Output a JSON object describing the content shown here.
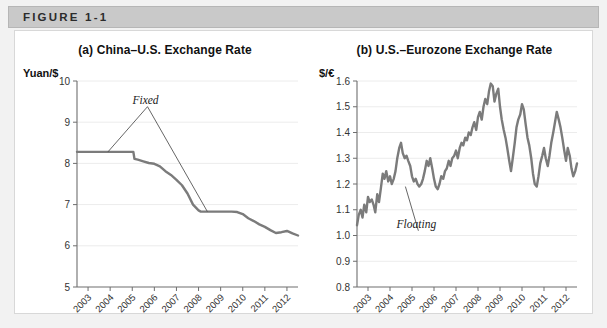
{
  "figure": {
    "header_label": "FIGURE 1-1"
  },
  "panels": [
    {
      "title": "(a) China–U.S. Exchange Rate",
      "unit_label": "Yuan/$",
      "annotation": "Fixed"
    },
    {
      "title": "(b) U.S.–Eurozone Exchange Rate",
      "unit_label": "$/€",
      "annotation": "Floating"
    }
  ],
  "colors": {
    "data_line": "#7b7b7b",
    "axis": "#6e6e6e",
    "grid": "#ececec",
    "header_band": "#c9c9c9",
    "panel_background": "#ffffff",
    "frame_background": "#f2f2f2"
  },
  "chart_data": [
    {
      "type": "line",
      "title": "(a) China–U.S. Exchange Rate",
      "xlabel": "",
      "ylabel": "Yuan/$",
      "ylim": [
        5,
        10
      ],
      "xlim": [
        2003,
        2013
      ],
      "yticks": [
        5,
        6,
        7,
        8,
        9,
        10
      ],
      "xticks": [
        2003,
        2004,
        2005,
        2006,
        2007,
        2008,
        2009,
        2010,
        2011,
        2012
      ],
      "grid": true,
      "legend": "none",
      "annotations": [
        {
          "text": "Fixed",
          "x": 2006.1,
          "y": 9.45,
          "leaders": [
            {
              "x": 2004.4,
              "y": 8.28
            },
            {
              "x": 2008.9,
              "y": 6.83
            }
          ]
        }
      ],
      "series": [
        {
          "name": "Yuan per US dollar",
          "x": [
            2003.0,
            2003.5,
            2004.0,
            2004.5,
            2005.0,
            2005.3,
            2005.55,
            2005.6,
            2005.75,
            2006.0,
            2006.25,
            2006.5,
            2006.75,
            2007.0,
            2007.25,
            2007.5,
            2007.75,
            2008.0,
            2008.25,
            2008.5,
            2008.6,
            2008.75,
            2009.0,
            2009.25,
            2009.5,
            2009.75,
            2010.0,
            2010.25,
            2010.5,
            2010.75,
            2011.0,
            2011.25,
            2011.5,
            2011.75,
            2012.0,
            2012.25,
            2012.5,
            2012.75,
            2013.0
          ],
          "y": [
            8.28,
            8.28,
            8.28,
            8.28,
            8.28,
            8.28,
            8.28,
            8.11,
            8.09,
            8.05,
            8.01,
            7.99,
            7.93,
            7.81,
            7.72,
            7.6,
            7.47,
            7.27,
            7.0,
            6.86,
            6.83,
            6.83,
            6.83,
            6.83,
            6.83,
            6.83,
            6.83,
            6.82,
            6.77,
            6.67,
            6.6,
            6.52,
            6.46,
            6.38,
            6.31,
            6.33,
            6.36,
            6.3,
            6.25
          ]
        }
      ]
    },
    {
      "type": "line",
      "title": "(b) U.S.–Eurozone Exchange Rate",
      "xlabel": "",
      "ylabel": "$/€",
      "ylim": [
        0.8,
        1.6
      ],
      "xlim": [
        2003,
        2013
      ],
      "yticks": [
        0.8,
        0.9,
        1.0,
        1.1,
        1.2,
        1.3,
        1.4,
        1.5,
        1.6
      ],
      "xticks": [
        2003,
        2004,
        2005,
        2006,
        2007,
        2008,
        2009,
        2010,
        2011,
        2012
      ],
      "grid": true,
      "legend": "none",
      "annotations": [
        {
          "text": "Floating",
          "x": 2005.7,
          "y": 1.03,
          "leaders": [
            {
              "x": 2005.2,
              "y": 1.19
            }
          ]
        }
      ],
      "series": [
        {
          "name": "US dollars per euro",
          "x": [
            2003.0,
            2003.08,
            2003.17,
            2003.25,
            2003.33,
            2003.42,
            2003.5,
            2003.58,
            2003.67,
            2003.75,
            2003.83,
            2003.92,
            2004.0,
            2004.08,
            2004.17,
            2004.25,
            2004.33,
            2004.42,
            2004.5,
            2004.58,
            2004.67,
            2004.75,
            2004.83,
            2004.92,
            2005.0,
            2005.08,
            2005.17,
            2005.25,
            2005.33,
            2005.42,
            2005.5,
            2005.58,
            2005.67,
            2005.75,
            2005.83,
            2005.92,
            2006.0,
            2006.08,
            2006.17,
            2006.25,
            2006.33,
            2006.42,
            2006.5,
            2006.58,
            2006.67,
            2006.75,
            2006.83,
            2006.92,
            2007.0,
            2007.08,
            2007.17,
            2007.25,
            2007.33,
            2007.42,
            2007.5,
            2007.58,
            2007.67,
            2007.75,
            2007.83,
            2007.92,
            2008.0,
            2008.08,
            2008.17,
            2008.25,
            2008.33,
            2008.42,
            2008.5,
            2008.58,
            2008.67,
            2008.75,
            2008.83,
            2008.92,
            2009.0,
            2009.08,
            2009.17,
            2009.25,
            2009.33,
            2009.42,
            2009.5,
            2009.58,
            2009.67,
            2009.75,
            2009.83,
            2009.92,
            2010.0,
            2010.08,
            2010.17,
            2010.25,
            2010.33,
            2010.42,
            2010.5,
            2010.58,
            2010.67,
            2010.75,
            2010.83,
            2010.92,
            2011.0,
            2011.08,
            2011.17,
            2011.25,
            2011.33,
            2011.42,
            2011.5,
            2011.58,
            2011.67,
            2011.75,
            2011.83,
            2011.92,
            2012.0,
            2012.08,
            2012.17,
            2012.25,
            2012.33,
            2012.42,
            2012.5,
            2012.58,
            2012.67,
            2012.75,
            2012.83,
            2012.92,
            2013.0
          ],
          "y": [
            1.04,
            1.08,
            1.1,
            1.07,
            1.12,
            1.09,
            1.15,
            1.13,
            1.14,
            1.12,
            1.09,
            1.16,
            1.13,
            1.18,
            1.24,
            1.22,
            1.25,
            1.21,
            1.23,
            1.2,
            1.22,
            1.25,
            1.3,
            1.34,
            1.36,
            1.32,
            1.3,
            1.31,
            1.29,
            1.27,
            1.23,
            1.21,
            1.22,
            1.2,
            1.19,
            1.2,
            1.22,
            1.25,
            1.29,
            1.27,
            1.3,
            1.26,
            1.22,
            1.19,
            1.18,
            1.2,
            1.23,
            1.22,
            1.25,
            1.26,
            1.29,
            1.27,
            1.3,
            1.31,
            1.33,
            1.3,
            1.34,
            1.36,
            1.35,
            1.38,
            1.37,
            1.4,
            1.39,
            1.42,
            1.44,
            1.41,
            1.46,
            1.48,
            1.45,
            1.5,
            1.53,
            1.51,
            1.56,
            1.59,
            1.58,
            1.52,
            1.55,
            1.57,
            1.5,
            1.45,
            1.41,
            1.38,
            1.34,
            1.29,
            1.25,
            1.3,
            1.36,
            1.42,
            1.45,
            1.47,
            1.51,
            1.49,
            1.43,
            1.38,
            1.35,
            1.3,
            1.24,
            1.2,
            1.19,
            1.23,
            1.28,
            1.31,
            1.34,
            1.3,
            1.27,
            1.31,
            1.36,
            1.4,
            1.44,
            1.48,
            1.45,
            1.42,
            1.38,
            1.33,
            1.29,
            1.34,
            1.31,
            1.26,
            1.23,
            1.25,
            1.28,
            1.26,
            1.29,
            1.31
          ]
        }
      ]
    }
  ]
}
